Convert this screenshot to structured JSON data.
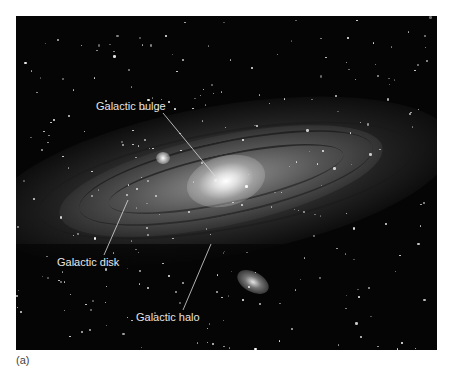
{
  "figure": {
    "background_color": "#050505",
    "label_color": "#e6e6e6",
    "leader_line_color": "#dcdcdc",
    "labels": [
      {
        "id": "bulge",
        "text": "Galactic bulge"
      },
      {
        "id": "disk",
        "text": "Galactic disk"
      },
      {
        "id": "halo",
        "text": "Galactic halo"
      }
    ]
  },
  "caption": {
    "text": "(a)"
  }
}
